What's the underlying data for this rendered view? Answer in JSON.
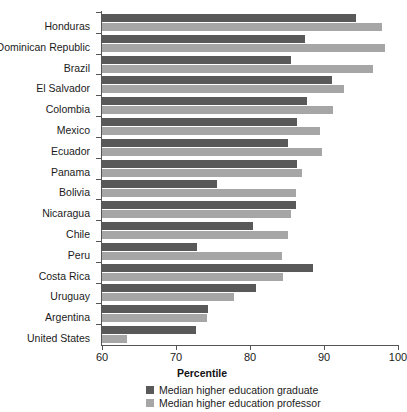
{
  "chart_data": {
    "type": "bar",
    "orientation": "horizontal",
    "title": "",
    "xlabel": "Percentile",
    "ylabel": "",
    "xlim": [
      60,
      100
    ],
    "xticks": [
      60,
      70,
      80,
      90,
      100
    ],
    "grid": false,
    "legend_position": "bottom",
    "categories": [
      "Honduras",
      "Dominican Republic",
      "Brazil",
      "El Salvador",
      "Colombia",
      "Mexico",
      "Ecuador",
      "Panama",
      "Bolivia",
      "Nicaragua",
      "Chile",
      "Peru",
      "Costa Rica",
      "Uruguay",
      "Argentina",
      "United States"
    ],
    "series": [
      {
        "name": "Median higher education graduate",
        "color": "#595959",
        "values": [
          94.3,
          87.4,
          85.6,
          91.1,
          87.7,
          86.4,
          85.1,
          86.4,
          75.5,
          86.2,
          80.4,
          72.8,
          88.5,
          80.8,
          74.3,
          72.7
        ]
      },
      {
        "name": "Median higher education professor",
        "color": "#a6a6a6",
        "values": [
          97.9,
          98.2,
          96.6,
          92.7,
          91.2,
          89.5,
          89.7,
          87.0,
          86.2,
          85.6,
          85.1,
          84.3,
          84.5,
          77.8,
          74.2,
          63.4
        ]
      }
    ]
  },
  "legend": {
    "items": [
      {
        "label": "Median higher education graduate",
        "color": "#595959",
        "swatch_name": "legend-swatch-graduate"
      },
      {
        "label": "Median higher education professor",
        "color": "#a6a6a6",
        "swatch_name": "legend-swatch-professor"
      }
    ]
  }
}
